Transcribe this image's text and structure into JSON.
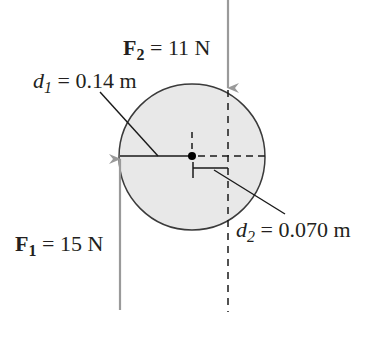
{
  "diagram": {
    "colors": {
      "disk_fill": "#e8e8e8",
      "disk_stroke": "#3a3a3a",
      "force_arrow": "#9a9a9a",
      "line": "#1a1a1a",
      "text": "#231f20"
    },
    "forces": [
      {
        "id": "F1",
        "symbol": "F",
        "subscript": "1",
        "equals": " = ",
        "value": "15 N",
        "direction": "up"
      },
      {
        "id": "F2",
        "symbol": "F",
        "subscript": "2",
        "equals": " = ",
        "value": "11 N",
        "direction": "down"
      }
    ],
    "distances": [
      {
        "id": "d1",
        "symbol": "d",
        "subscript": "1",
        "equals": " = ",
        "value": "0.14 m"
      },
      {
        "id": "d2",
        "symbol": "d",
        "subscript": "2",
        "equals": " = ",
        "value": "0.070 m"
      }
    ],
    "elements": [
      "disk",
      "axis-point",
      "lever-arm-d1",
      "lever-arm-d2",
      "line-of-action-F2"
    ]
  }
}
